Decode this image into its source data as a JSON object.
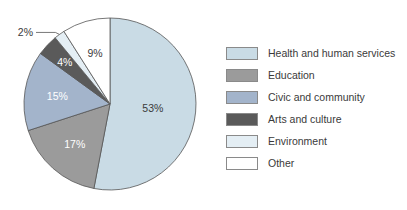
{
  "chart_data": {
    "type": "pie",
    "title": "",
    "categories": [
      "Health and human services",
      "Education",
      "Civic and community",
      "Arts and culture",
      "Environment",
      "Other"
    ],
    "values": [
      53,
      17,
      15,
      4,
      2,
      9
    ],
    "labels": [
      "53%",
      "17%",
      "15%",
      "4%",
      "2%",
      "9%"
    ],
    "colors": [
      "#c9dbe5",
      "#9b9b9b",
      "#a3b4cb",
      "#5a5a5a",
      "#e4eef4",
      "#ffffff"
    ],
    "label_colors": [
      "#3a3a3a",
      "#ffffff",
      "#ffffff",
      "#ffffff",
      "#3a3a3a",
      "#3a3a3a"
    ],
    "start_angle_deg": 0,
    "direction": "clockwise",
    "legend_position": "right"
  },
  "legend": {
    "items": [
      {
        "label": "Health and human services",
        "color": "#c9dbe5"
      },
      {
        "label": "Education",
        "color": "#9b9b9b"
      },
      {
        "label": "Civic and community",
        "color": "#a3b4cb"
      },
      {
        "label": "Arts and culture",
        "color": "#5a5a5a"
      },
      {
        "label": "Environment",
        "color": "#e4eef4"
      },
      {
        "label": "Other",
        "color": "#ffffff"
      }
    ]
  }
}
